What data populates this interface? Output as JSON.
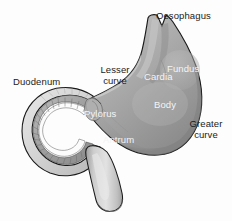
{
  "diagram": {
    "background_color": "#fdfdfd",
    "outline_color": "#1a1a1a",
    "labels": {
      "oesophagus": "Oesophagus",
      "lesser_curve": "Lesser\ncurve",
      "duodenum": "Duodenum",
      "greater_curve": "Greater\ncurve",
      "fundus": "Fundus",
      "cardia": "Cardia",
      "body": "Body",
      "pylorus": "Pylorus",
      "antrum": "Antrum"
    },
    "label_colors": {
      "external": "#1b1b1b",
      "internal": "#f4f4f4"
    },
    "structures": [
      {
        "name": "oesophagus",
        "label_placement": "external-top-right",
        "fill": "#9d9d9d"
      },
      {
        "name": "stomach-body",
        "label_placement": "internal",
        "fill": "#a0a0a0"
      },
      {
        "name": "fundus",
        "label_placement": "internal",
        "fill": "#a4a4a4"
      },
      {
        "name": "cardia",
        "label_placement": "internal",
        "fill": "#a6a6a6"
      },
      {
        "name": "antrum",
        "label_placement": "internal",
        "fill": "#989898"
      },
      {
        "name": "pylorus",
        "label_placement": "internal",
        "fill": "#9a9a9a"
      },
      {
        "name": "duodenum",
        "label_placement": "external-left",
        "fill": "#b9b9b9",
        "detail": "C-shaped ring with inner mucosal folds"
      },
      {
        "name": "lesser-curve",
        "label_placement": "external-upper-left"
      },
      {
        "name": "greater-curve",
        "label_placement": "external-right"
      }
    ],
    "palette": {
      "tissue_light": "#cfcfcf",
      "tissue_mid": "#a8a8a8",
      "tissue_dark": "#808080",
      "lumen_white": "#fdfdfd",
      "mucosa_gray": "#9b9b9b",
      "wall_pale": "#dedede"
    }
  }
}
